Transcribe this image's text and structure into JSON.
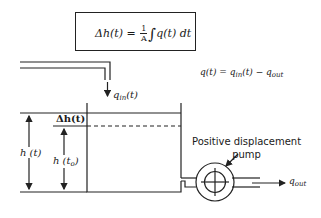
{
  "formula_box": {
    "lhs": "Δh(t) =",
    "frac_num": "1",
    "frac_den": "A",
    "integral": "∫",
    "upper": "t",
    "lower": "t₀",
    "integrand": "q(t) dt"
  },
  "flow_equation": {
    "lhs": "q(t) = q",
    "in_sub": "in",
    "mid": "(t) − q",
    "out_sub": "out"
  },
  "labels": {
    "q_in_main": "q",
    "q_in_sub": "in",
    "q_in_tail": "(t)",
    "delta_h": "Δh(t)",
    "h_t": "h (t)",
    "h_t0_main": "h (t",
    "h_t0_sub": "o",
    "h_t0_tail": ")",
    "pump_line1": "Positive displacement",
    "pump_line2": "pump",
    "q_out_main": "q",
    "q_out_sub": "out"
  },
  "colors": {
    "stroke": "#222222",
    "background": "#ffffff"
  }
}
